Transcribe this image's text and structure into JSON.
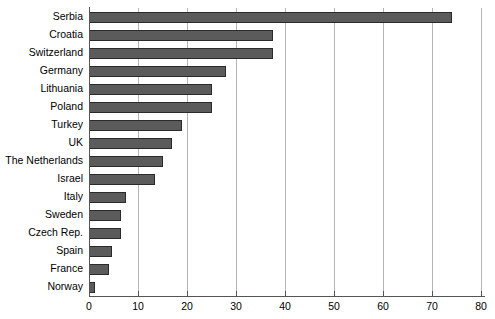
{
  "chart_data": {
    "type": "bar",
    "orientation": "horizontal",
    "title": "",
    "subtitle": "",
    "xlabel": "",
    "ylabel": "",
    "xlim": [
      0,
      80
    ],
    "ylim": null,
    "grid": true,
    "legend": null,
    "legend_position": "none",
    "xticks": [
      0,
      10,
      20,
      30,
      40,
      50,
      60,
      70,
      80
    ],
    "categories": [
      "Serbia",
      "Croatia",
      "Switzerland",
      "Germany",
      "Lithuania",
      "Poland",
      "Turkey",
      "UK",
      "The Netherlands",
      "Israel",
      "Italy",
      "Sweden",
      "Czech Rep.",
      "Spain",
      "France",
      "Norway"
    ],
    "values": [
      74,
      37.5,
      37.5,
      28,
      25,
      25,
      19,
      17,
      15,
      13.5,
      7.5,
      6.5,
      6.5,
      4.7,
      4,
      1.3
    ],
    "bar_color": "#5b5b5b",
    "bar_edge_color": "#2a2a2a",
    "grid_color": "#b4b4b4",
    "axis_color": "#555555",
    "background_color": "#ffffff"
  }
}
